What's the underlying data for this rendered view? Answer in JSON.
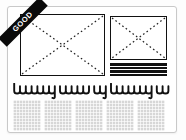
{
  "badge": {
    "label": "GOOD",
    "background": "#0a0a0a",
    "text_color": "#ffffff"
  },
  "layout_preview": {
    "hero_image": {
      "icon": "image-placeholder-x-icon"
    },
    "secondary_image": {
      "icon": "image-placeholder-x-icon"
    },
    "sidebar_text_bars": {
      "count": 4,
      "color": "#111111"
    },
    "headline_scribble": {
      "stroke_color": "#111111",
      "words": [
        {
          "humps": 7,
          "tall_first": true,
          "descender": true
        },
        {
          "humps": 5,
          "tall_first": false,
          "descender": false
        },
        {
          "humps": 2,
          "tall_first": false,
          "descender": true
        },
        {
          "humps": 7,
          "tall_first": true,
          "descender": true
        },
        {
          "humps": 2,
          "tall_first": false,
          "descender": false
        }
      ]
    },
    "body_text_blocks": {
      "count": 5,
      "fill": "#d7d7d7"
    }
  },
  "colors": {
    "card_border": "#c9c9c9",
    "card_background": "#ffffff",
    "placeholder_border": "#111111"
  }
}
